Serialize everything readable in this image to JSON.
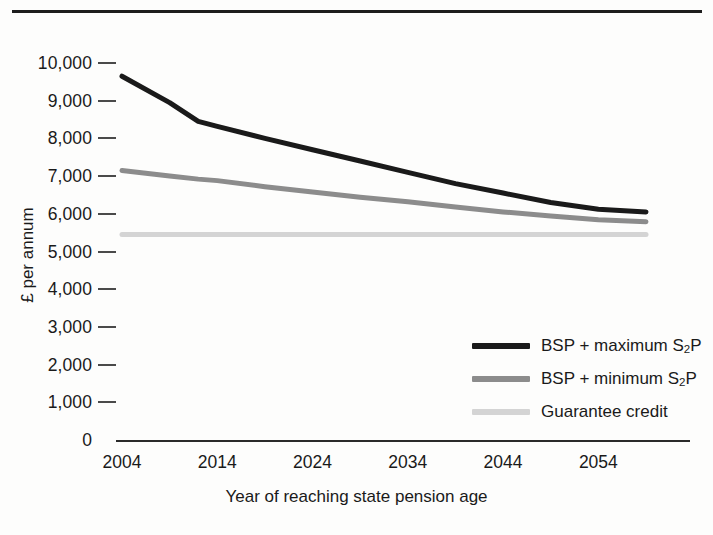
{
  "chart_data": {
    "type": "line",
    "title": "",
    "xlabel": "Year of reaching state pension age",
    "ylabel": "£ per annum",
    "xlim": [
      2004,
      2059
    ],
    "ylim": [
      0,
      10000
    ],
    "grid": false,
    "legend_position": "inside-bottom-right",
    "x_tick_labels": [
      "2004",
      "2014",
      "2024",
      "2034",
      "2044",
      "2054"
    ],
    "x_tick_values": [
      2004,
      2014,
      2024,
      2034,
      2044,
      2054
    ],
    "y_tick_labels": [
      "0",
      "1,000",
      "2,000",
      "3,000",
      "4,000",
      "5,000",
      "6,000",
      "7,000",
      "8,000",
      "9,000",
      "10,000"
    ],
    "y_tick_values": [
      0,
      1000,
      2000,
      3000,
      4000,
      5000,
      6000,
      7000,
      8000,
      9000,
      10000
    ],
    "x": [
      2004,
      2009,
      2012,
      2014,
      2019,
      2024,
      2029,
      2034,
      2039,
      2044,
      2049,
      2054,
      2059
    ],
    "series": [
      {
        "name": "BSP + maximum S2P",
        "name_plain": "BSP + maximum S2P",
        "color": "#1a1a1a",
        "values": [
          9650,
          8950,
          8450,
          8320,
          8000,
          7700,
          7400,
          7100,
          6800,
          6550,
          6300,
          6120,
          6050
        ]
      },
      {
        "name": "BSP + minimum S2P",
        "name_plain": "BSP + minimum S2P",
        "color": "#8c8c8c",
        "values": [
          7150,
          7000,
          6920,
          6880,
          6720,
          6580,
          6440,
          6320,
          6180,
          6050,
          5940,
          5840,
          5790
        ]
      },
      {
        "name": "Guarantee credit",
        "name_plain": "Guarantee credit",
        "color": "#d4d4d4",
        "values": [
          5450,
          5450,
          5450,
          5450,
          5450,
          5450,
          5450,
          5450,
          5450,
          5450,
          5450,
          5450,
          5450
        ]
      }
    ]
  },
  "axes": {
    "y_title": "£ per annum",
    "x_title": "Year of reaching state pension age"
  },
  "legend": {
    "items": [
      {
        "label_prefix": "BSP + maximum S",
        "label_sub": "2",
        "label_suffix": "P",
        "color": "#1a1a1a"
      },
      {
        "label_prefix": "BSP + minimum S",
        "label_sub": "2",
        "label_suffix": "P",
        "color": "#8c8c8c"
      },
      {
        "label_prefix": "Guarantee credit",
        "label_sub": "",
        "label_suffix": "",
        "color": "#d4d4d4"
      }
    ]
  },
  "colors": {
    "max_s2p": "#1a1a1a",
    "min_s2p": "#8c8c8c",
    "guarantee_credit": "#d4d4d4",
    "axis": "#2a2a2a",
    "background": "#fdfdfc"
  }
}
